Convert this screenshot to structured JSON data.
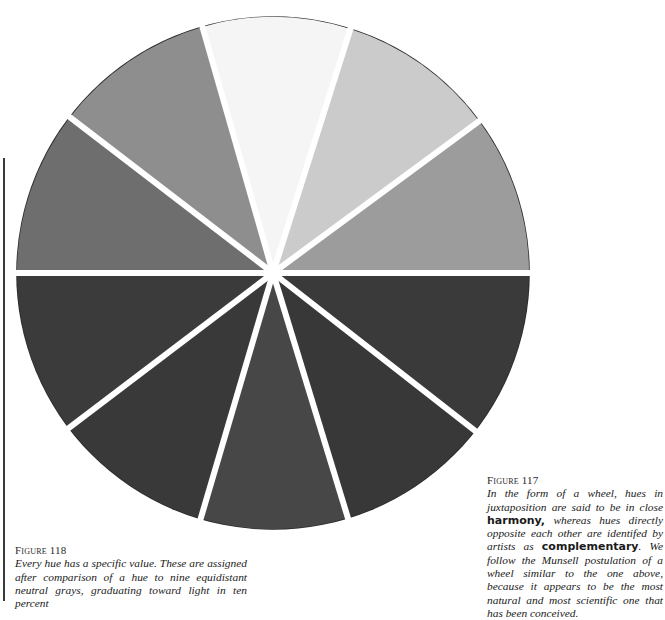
{
  "figure_117": {
    "label": "Figure 117",
    "text_1": "In the form of a wheel, hues in juxtaposition are said to be in close ",
    "bold_1": "harmony,",
    "text_2": " whereas hues directly opposite each other are identifed by artists as ",
    "bold_2": "complementary",
    "text_3": ". We follow the Munsell postulation of a wheel similar to the one above, because it appears to be the most natural and most scientific one that has been conceived."
  },
  "figure_118": {
    "label": "Figure 118",
    "text": "Every hue has a specific value. These are assigned after comparison of a hue to nine equidistant neutral grays, graduating toward light in ten percent"
  },
  "wheel": {
    "center": [
      273,
      273
    ],
    "radius": 256,
    "divider_color": "#ffffff",
    "rim_color": "#2b2b2b",
    "segments": [
      {
        "start": 0,
        "end": 38,
        "color": "#3a3a3a"
      },
      {
        "start": 38,
        "end": 73,
        "color": "#383838"
      },
      {
        "start": 73,
        "end": 106.4,
        "color": "#474747"
      },
      {
        "start": 106.4,
        "end": 142.8,
        "color": "#393939"
      },
      {
        "start": 142.8,
        "end": 180,
        "color": "#3b3b3b"
      },
      {
        "start": 180,
        "end": 217.5,
        "color": "#6e6e6e"
      },
      {
        "start": 217.5,
        "end": 254,
        "color": "#8e8e8e"
      },
      {
        "start": 254,
        "end": 287.6,
        "color": "#f5f5f5"
      },
      {
        "start": 287.6,
        "end": 323.6,
        "color": "#cbcbcb"
      },
      {
        "start": 323.6,
        "end": 360,
        "color": "#9c9c9c"
      }
    ]
  }
}
